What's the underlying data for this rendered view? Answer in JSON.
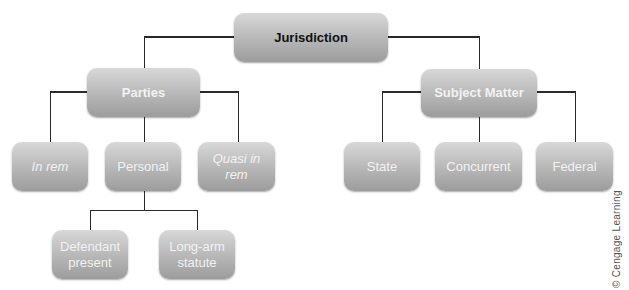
{
  "diagram": {
    "root": {
      "label": "Jurisdiction"
    },
    "branches": [
      {
        "label": "Parties",
        "children": [
          {
            "label": "In rem",
            "italic": true
          },
          {
            "label": "Personal",
            "italic": false,
            "children": [
              {
                "label": "Defendant present"
              },
              {
                "label": "Long-arm statute"
              }
            ]
          },
          {
            "label": "Quasi in rem",
            "italic": true
          }
        ]
      },
      {
        "label": "Subject Matter",
        "children": [
          {
            "label": "State"
          },
          {
            "label": "Concurrent"
          },
          {
            "label": "Federal"
          }
        ]
      }
    ]
  },
  "colors": {
    "root_fill": "#9a9a9a",
    "parties_branch_fill": "#202020",
    "subject_matter_branch_fill": "#4a4a4a",
    "connector": "#2a2a2a"
  },
  "credit": "© Cengage Learning"
}
